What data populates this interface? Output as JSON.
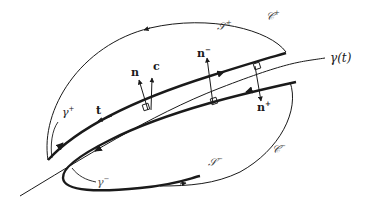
{
  "diagram": {
    "type": "geometric-figure",
    "colors": {
      "stroke": "#1a1a1a",
      "background": "#ffffff",
      "script_label": "#444444"
    },
    "curve": {
      "label": "γ(t)"
    },
    "vectors": {
      "tangent": "t",
      "normal": "n",
      "c": "c",
      "n_minus": {
        "base": "n",
        "sup": "−"
      },
      "n_plus": {
        "base": "n",
        "sup": "+"
      }
    },
    "surfaces": {
      "upper": {
        "base": "𝒮",
        "sup": "+"
      },
      "lower": {
        "base": "𝒮",
        "sup": "−"
      }
    },
    "boundaries": {
      "upper": {
        "base": "𝒞",
        "sup": "+"
      },
      "lower": {
        "base": "𝒞",
        "sup": "−"
      }
    },
    "arcs": {
      "gamma_plus": {
        "base": "γ",
        "sup": "+"
      },
      "gamma_minus": {
        "base": "γ",
        "sup": "−"
      }
    }
  }
}
